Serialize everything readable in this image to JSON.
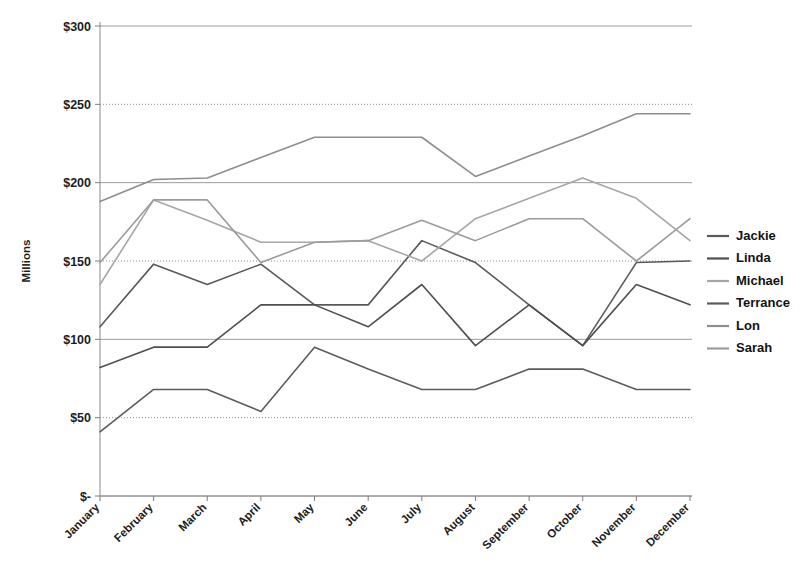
{
  "chart_data": {
    "type": "line",
    "title": "",
    "xlabel": "",
    "ylabel": "Millions",
    "ylim": [
      0,
      300
    ],
    "ytick_values": [
      0,
      50,
      100,
      150,
      200,
      250,
      300
    ],
    "ytick_labels": [
      "$-",
      "$50",
      "$100",
      "$150",
      "$200",
      "$250",
      "$300"
    ],
    "grid": "horizontal",
    "legend_position": "right",
    "categories": [
      "January",
      "February",
      "March",
      "April",
      "May",
      "June",
      "July",
      "August",
      "September",
      "October",
      "November",
      "December"
    ],
    "series": [
      {
        "name": "Jackie",
        "color": "#595959",
        "values": [
          108,
          148,
          135,
          148,
          122,
          122,
          163,
          149,
          122,
          96,
          149,
          150
        ]
      },
      {
        "name": "Linda",
        "color": "#4f4f4f",
        "values": [
          82,
          95,
          95,
          122,
          122,
          108,
          135,
          96,
          122,
          96,
          135,
          122
        ]
      },
      {
        "name": "Michael",
        "color": "#a6a6a6",
        "values": [
          135,
          189,
          176,
          162,
          162,
          163,
          150,
          177,
          190,
          203,
          190,
          163
        ]
      },
      {
        "name": "Terrance",
        "color": "#5c5c5c",
        "values": [
          41,
          68,
          68,
          54,
          95,
          81,
          68,
          68,
          81,
          81,
          68,
          68
        ]
      },
      {
        "name": "Lon",
        "color": "#8e8e8e",
        "values": [
          188,
          202,
          203,
          216,
          229,
          229,
          229,
          204,
          217,
          230,
          244,
          244
        ]
      },
      {
        "name": "Sarah",
        "color": "#9b9b9b",
        "values": [
          149,
          189,
          189,
          149,
          162,
          163,
          176,
          163,
          177,
          177,
          150,
          177
        ]
      }
    ]
  },
  "legend": {
    "items": [
      {
        "label": "Jackie"
      },
      {
        "label": "Linda"
      },
      {
        "label": "Michael"
      },
      {
        "label": "Terrance"
      },
      {
        "label": "Lon"
      },
      {
        "label": "Sarah"
      }
    ]
  }
}
